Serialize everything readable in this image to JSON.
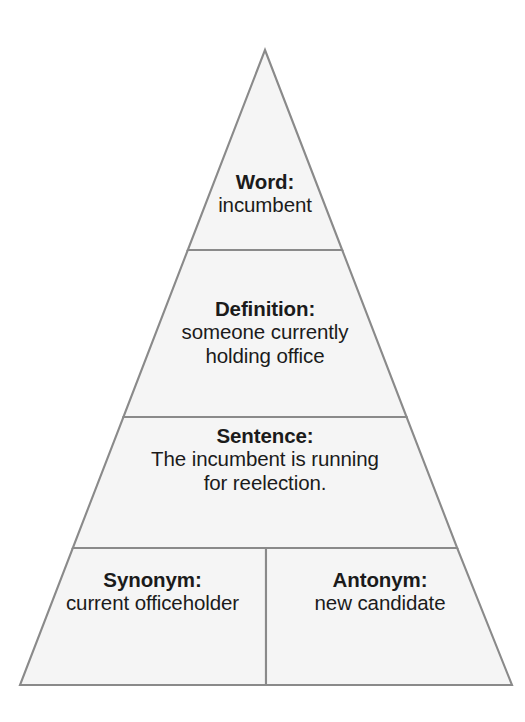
{
  "diagram": {
    "type": "word-pyramid-graphic-organizer",
    "shape": "triangle",
    "colors": {
      "background": "#ffffff",
      "band_fill": "#f5f5f5",
      "band_stroke": "#8a8a8a",
      "text": "#1b1b1b"
    },
    "geometry": {
      "apex_x": 265,
      "apex_y": 50,
      "base_left_x": 20,
      "base_right_x": 512,
      "base_y": 685,
      "divider_y_1": 250,
      "divider_y_2": 417,
      "divider_y_3": 548,
      "vertical_divider_x": 266
    },
    "bands": [
      {
        "id": "word",
        "title": "Word:",
        "body": "incumbent"
      },
      {
        "id": "definition",
        "title": "Definition:",
        "body_line_1": "someone currently",
        "body_line_2": "holding office"
      },
      {
        "id": "sentence",
        "title": "Sentence:",
        "body_line_1": "The incumbent is running",
        "body_line_2": "for reelection."
      },
      {
        "id": "synonym",
        "title": "Synonym:",
        "body": "current officeholder"
      },
      {
        "id": "antonym",
        "title": "Antonym:",
        "body": "new candidate"
      }
    ]
  }
}
